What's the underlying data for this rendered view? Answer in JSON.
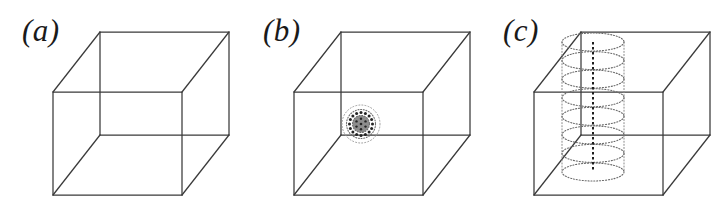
{
  "figure": {
    "background_color": "#ffffff",
    "panel_count": 3,
    "width": 722,
    "height": 206
  },
  "style": {
    "edge_color": "#3a3a3a",
    "dotted_color": "#6e6e6e",
    "dot_color": "#242424",
    "core_color": "#8d8d8d",
    "axis_color": "#1e1e1e",
    "label_color": "#1a1a1a"
  },
  "geometry": {
    "front_face": {
      "left": 53,
      "right": 182,
      "top": 92,
      "bottom": 195
    },
    "depth_offset": {
      "dx": 47,
      "dy": -60
    },
    "projection": "oblique-cabinet",
    "edges_visible": 12,
    "transparent": true
  },
  "panels": [
    {
      "id": "a",
      "label": "(a)",
      "content": "empty-cube",
      "description": "Transparent wireframe cube with no interior structure"
    },
    {
      "id": "b",
      "label": "(b)",
      "content": "cube-with-sphere",
      "description": "Transparent wireframe cube with a small spherical inclusion at the centre",
      "sphere": {
        "center_x": 120,
        "center_y": 124,
        "outer_radius": 19,
        "mid_radius": 14.5,
        "core_radius": 8.5,
        "dot_ring_radius": 11.5,
        "dot_count": 16
      }
    },
    {
      "id": "c",
      "label": "(c)",
      "content": "cube-with-cylinder",
      "description": "Transparent wireframe cube containing a vertical cylinder spanning the full height, drawn as stacked dotted ellipses with a dotted central axis",
      "cylinder": {
        "center_x": 112,
        "radius_x": 31,
        "radius_y": 9,
        "top_y": 42,
        "bottom_y": 172,
        "ellipse_count": 8,
        "axis_dotted": true
      }
    }
  ]
}
